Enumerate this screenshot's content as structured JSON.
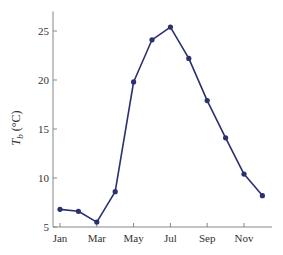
{
  "chart_data": {
    "type": "line",
    "title": "",
    "xlabel": "",
    "ylabel": "T_b (°C)",
    "ylabel_main": "T",
    "ylabel_sub": "b",
    "ylabel_unit": " (°C)",
    "ylim": [
      5,
      27
    ],
    "yticks": [
      5,
      10,
      15,
      20,
      25
    ],
    "x": [
      "Jan",
      "Feb",
      "Mar",
      "Apr",
      "May",
      "Jun",
      "Jul",
      "Aug",
      "Sep",
      "Oct",
      "Nov",
      "Dec"
    ],
    "xtick_labels": [
      "Jan",
      "Mar",
      "May",
      "Jul",
      "Sep",
      "Nov"
    ],
    "series": [
      {
        "name": "T_b",
        "color": "#2b3070",
        "values": [
          6.8,
          6.6,
          5.5,
          8.6,
          19.8,
          24.1,
          25.4,
          22.2,
          17.9,
          14.1,
          10.4,
          8.2
        ]
      }
    ],
    "grid": false,
    "legend": "none"
  }
}
